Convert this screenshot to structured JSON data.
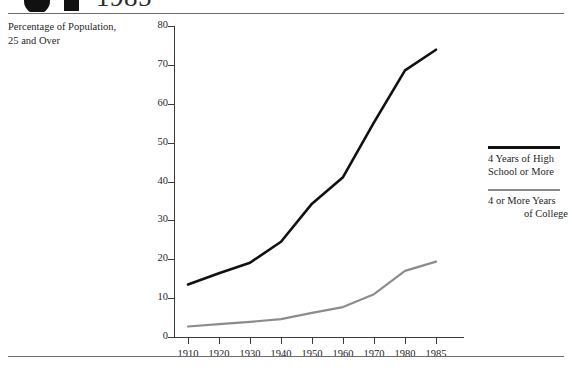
{
  "header": {
    "year": "1985",
    "disc_icon": "filled-circle-icon",
    "square_icon": "filled-square-icon"
  },
  "axis_caption": {
    "line1": "Percentage of Population,",
    "line2": "25 and Over"
  },
  "legend": {
    "entries": [
      {
        "label_line1": "4 Years of High",
        "label_line2": "School or More",
        "color": "#111111"
      },
      {
        "label_line1": "4 or More Years",
        "label_line2": "of College",
        "color": "#8c8c8c"
      }
    ]
  },
  "chart_data": {
    "type": "line",
    "title": "",
    "xlabel": "",
    "ylabel": "Percentage of Population, 25 and Over",
    "categories": [
      "1910",
      "1920",
      "1930",
      "1940",
      "1950",
      "1960",
      "1970",
      "1980",
      "1985"
    ],
    "yticks": [
      0,
      10,
      20,
      30,
      40,
      50,
      60,
      70,
      80
    ],
    "ylim": [
      0,
      80
    ],
    "grid": false,
    "legend_position": "right",
    "series": [
      {
        "name": "4 Years of High School or More",
        "color": "#111111",
        "width": 2.6,
        "values": [
          13.5,
          16.4,
          19.1,
          24.5,
          34.3,
          41.1,
          55.2,
          68.6,
          73.9
        ]
      },
      {
        "name": "4 or More Years of College",
        "color": "#8c8c8c",
        "width": 2.2,
        "values": [
          2.7,
          3.3,
          3.9,
          4.6,
          6.2,
          7.7,
          11.0,
          17.0,
          19.4
        ]
      }
    ]
  }
}
